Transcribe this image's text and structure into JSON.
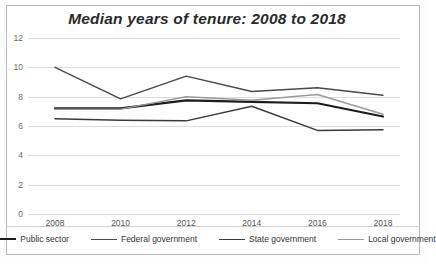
{
  "chart_data": {
    "type": "line",
    "title": "Median years of tenure: 2008 to 2018",
    "xlabel": "",
    "ylabel": "",
    "x": [
      2008,
      2010,
      2012,
      2014,
      2016,
      2018
    ],
    "categories": [
      "2008",
      "2010",
      "2012",
      "2014",
      "2016",
      "2018"
    ],
    "ylim": [
      0,
      12
    ],
    "yticks": [
      0,
      2,
      4,
      6,
      8,
      10,
      12
    ],
    "ytick_labels": [
      "0",
      "2",
      "4",
      "6",
      "8",
      "10",
      "12"
    ],
    "grid": "horizontal",
    "legend_position": "bottom",
    "series": [
      {
        "name": "Public sector",
        "values": [
          7.2,
          7.2,
          7.75,
          7.65,
          7.55,
          6.65
        ],
        "color": "#1c1c1c",
        "width": 2.2
      },
      {
        "name": "Federal government",
        "values": [
          10.0,
          7.85,
          9.4,
          8.35,
          8.6,
          8.1
        ],
        "color": "#4a4a4a",
        "width": 1.5
      },
      {
        "name": "State government",
        "values": [
          6.5,
          6.4,
          6.35,
          7.35,
          5.7,
          5.75
        ],
        "color": "#3a3a3a",
        "width": 1.5
      },
      {
        "name": "Local government",
        "values": [
          7.15,
          7.15,
          8.0,
          7.75,
          8.15,
          6.8
        ],
        "color": "#9a9a9a",
        "width": 1.5
      }
    ]
  }
}
